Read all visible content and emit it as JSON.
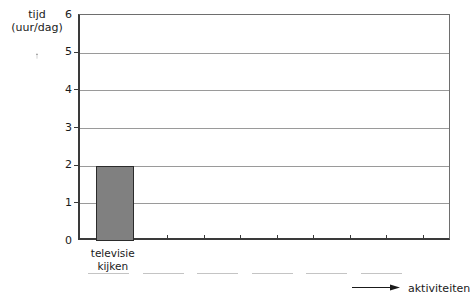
{
  "chart_data": {
    "type": "bar",
    "title": "",
    "subtitle": "",
    "xlabel": "aktiviteiten",
    "ylabel": "tijd (uur/dag)",
    "ylabel_lines": [
      "tijd",
      "(uur/dag)"
    ],
    "categories": [
      "televisie kijken"
    ],
    "category_lines": [
      [
        "televisie",
        "kijken"
      ]
    ],
    "values": [
      2
    ],
    "ylim": [
      0,
      6
    ],
    "ytick_labels": [
      "0",
      "1",
      "2",
      "3",
      "4",
      "5",
      "6"
    ],
    "ytick_values": [
      0,
      1,
      2,
      3,
      4,
      5,
      6
    ],
    "grid": true,
    "grid_axis": "y",
    "legend": "none",
    "bar_color": "#808080",
    "bar_edge_color": "#2b2b2b",
    "axis_color": "#3a3a3a",
    "grid_color": "#9a9a9a",
    "background_color": "#ffffff",
    "empty_category_slots": 9,
    "blank_answer_lines": 6,
    "x_tick_count": 10
  },
  "axes": {
    "y_arrow_icon": "up-arrow-icon",
    "x_arrow_icon": "right-arrow-icon"
  }
}
